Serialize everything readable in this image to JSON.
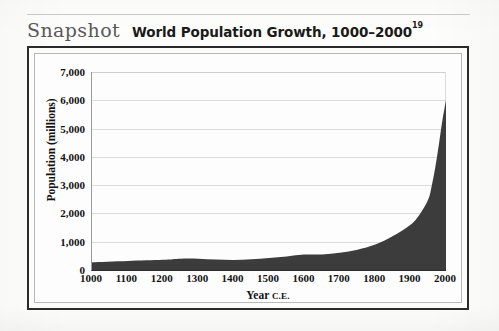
{
  "page": {
    "kicker": "Snapshot",
    "title": "World Population Growth, 1000–2000",
    "title_note": "19"
  },
  "chart_data": {
    "type": "area",
    "title": "World Population Growth, 1000–2000",
    "xlabel": "Year",
    "xlabel_suffix": "C.E.",
    "ylabel": "Population (millions)",
    "xlim": [
      1000,
      2000
    ],
    "ylim": [
      0,
      7000
    ],
    "grid": true,
    "legend": "none",
    "fill_color": "#3c3c3c",
    "grid_color": "#dcdcdc",
    "background_color": "#fdfdfd",
    "x_ticks": [
      1000,
      1100,
      1200,
      1300,
      1400,
      1500,
      1600,
      1700,
      1800,
      1900,
      2000
    ],
    "x_tick_labels": [
      "1000",
      "1100",
      "1200",
      "1300",
      "1400",
      "1500",
      "1600",
      "1700",
      "1800",
      "1900",
      "2000"
    ],
    "y_ticks": [
      0,
      1000,
      2000,
      3000,
      4000,
      5000,
      6000,
      7000
    ],
    "y_tick_labels": [
      "0",
      "1,000",
      "2,000",
      "3,000",
      "4,000",
      "5,000",
      "6,000",
      "7,000"
    ],
    "x": [
      1000,
      1100,
      1200,
      1250,
      1300,
      1350,
      1400,
      1450,
      1500,
      1550,
      1600,
      1650,
      1700,
      1750,
      1800,
      1850,
      1900,
      1925,
      1950,
      1960,
      1970,
      1980,
      1990,
      2000
    ],
    "values": [
      275,
      320,
      360,
      400,
      400,
      370,
      350,
      380,
      425,
      480,
      545,
      550,
      610,
      720,
      900,
      1200,
      1600,
      1950,
      2500,
      3000,
      3650,
      4450,
      5300,
      6000
    ],
    "series": [
      {
        "name": "World population (millions)",
        "values": [
          275,
          320,
          360,
          400,
          400,
          370,
          350,
          380,
          425,
          480,
          545,
          550,
          610,
          720,
          900,
          1200,
          1600,
          1950,
          2500,
          3000,
          3650,
          4450,
          5300,
          6000
        ]
      }
    ],
    "annotations": []
  }
}
